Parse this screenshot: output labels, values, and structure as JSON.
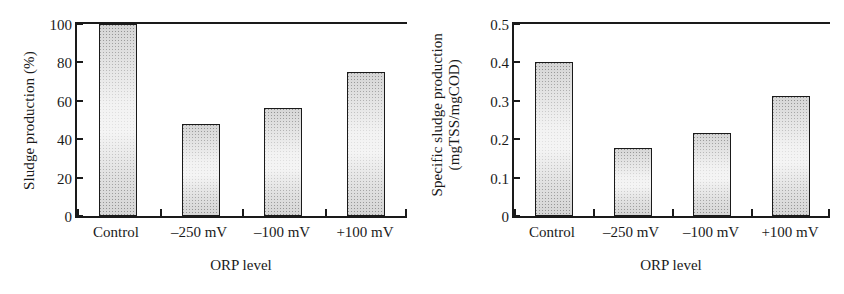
{
  "figure": {
    "background_color": "#ffffff",
    "ink_color": "#1a1a1a",
    "bar_fill_color": "#d6d6d6",
    "bar_edge_color": "#1a1a1a"
  },
  "panels": [
    {
      "id": "left",
      "ylabel": "Sludge production (%)",
      "xlabel": "ORP level"
    },
    {
      "id": "right",
      "ylabel_line1": "Specific sludge production",
      "ylabel_line2": "(mgTSS/mgCOD)",
      "xlabel": "ORP level"
    }
  ],
  "chart_data": [
    {
      "type": "bar",
      "title": "",
      "xlabel": "ORP level",
      "ylabel": "Sludge production (%)",
      "categories": [
        "Control",
        "–250 mV",
        "–100 mV",
        "+100 mV"
      ],
      "values": [
        100,
        48,
        56,
        75
      ],
      "ylim": [
        0,
        100
      ],
      "yticks": [
        0,
        20,
        40,
        60,
        80,
        100
      ],
      "ytick_labels": [
        "0",
        "20",
        "40",
        "60",
        "80",
        "100"
      ],
      "grid": false,
      "legend": "none"
    },
    {
      "type": "bar",
      "title": "",
      "xlabel": "ORP level",
      "ylabel": "Specific sludge production (mgTSS/mgCOD)",
      "categories": [
        "Control",
        "–250 mV",
        "–100 mV",
        "+100 mV"
      ],
      "values": [
        0.4,
        0.178,
        0.215,
        0.312
      ],
      "ylim": [
        0,
        0.5
      ],
      "yticks": [
        0,
        0.1,
        0.2,
        0.3,
        0.4,
        0.5
      ],
      "ytick_labels": [
        "0",
        "0.1",
        "0.2",
        "0.3",
        "0.4",
        "0.5"
      ],
      "grid": false,
      "legend": "none"
    }
  ]
}
